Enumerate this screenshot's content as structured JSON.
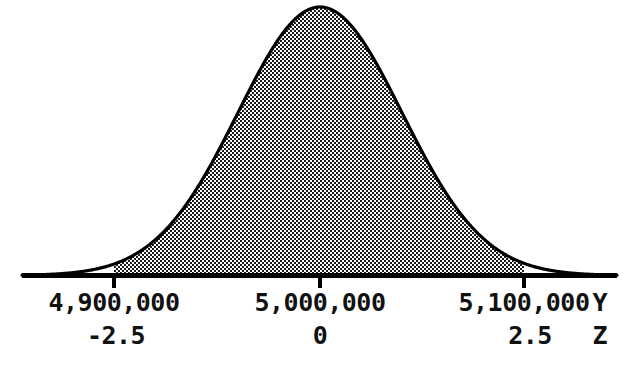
{
  "figure": {
    "background_color": "#ffffff",
    "ink_color": "#000000",
    "fill_style": "checkerboard-dither-gray"
  },
  "chart_data": {
    "type": "area",
    "title": "",
    "subtitle": "",
    "xlabel": "",
    "ylabel": "",
    "distribution": "normal",
    "mean": 5000000,
    "sigma": 40000,
    "grid": false,
    "legend": null,
    "axes": [
      {
        "name": "Y",
        "axis_name_label": "Y",
        "tick_values": [
          4900000,
          5000000,
          5100000
        ],
        "tick_labels": [
          "4,900,000",
          "5,000,000",
          "5,100,000"
        ]
      },
      {
        "name": "Z",
        "axis_name_label": "Z",
        "tick_values": [
          -2.5,
          0,
          2.5
        ],
        "tick_labels": [
          "-2.5",
          "0",
          "2.5"
        ]
      }
    ],
    "shaded_region": {
      "from_z": -2.5,
      "to_z": 2.5,
      "from_y": 4900000,
      "to_y": 5100000,
      "style": "dither-shaded"
    },
    "x": [
      -4.0,
      -3.8,
      -3.6,
      -3.4,
      -3.2,
      -3.0,
      -2.8,
      -2.6,
      -2.5,
      -2.4,
      -2.2,
      -2.0,
      -1.8,
      -1.6,
      -1.4,
      -1.2,
      -1.0,
      -0.8,
      -0.6,
      -0.4,
      -0.2,
      0.0,
      0.2,
      0.4,
      0.6,
      0.8,
      1.0,
      1.2,
      1.4,
      1.6,
      1.8,
      2.0,
      2.2,
      2.4,
      2.5,
      2.6,
      2.8,
      3.0,
      3.2,
      3.4,
      3.6,
      3.8,
      4.0
    ],
    "y": [
      0.0001,
      0.0003,
      0.0006,
      0.0012,
      0.0024,
      0.0044,
      0.0079,
      0.0136,
      0.0175,
      0.0224,
      0.0355,
      0.054,
      0.079,
      0.1109,
      0.1497,
      0.1942,
      0.242,
      0.2897,
      0.3332,
      0.3683,
      0.391,
      0.3989,
      0.391,
      0.3683,
      0.3332,
      0.2897,
      0.242,
      0.1942,
      0.1497,
      0.1109,
      0.079,
      0.054,
      0.0355,
      0.0224,
      0.0175,
      0.0136,
      0.0079,
      0.0044,
      0.0024,
      0.0012,
      0.0006,
      0.0003,
      0.0001
    ],
    "ylim": [
      0,
      0.4
    ],
    "xlim": [
      -4.0,
      4.0
    ]
  },
  "axis_labels": {
    "y_row": [
      {
        "text": "4,900,000",
        "x": 114
      },
      {
        "text": "5,000,000",
        "x": 320
      },
      {
        "text": "5,100,000",
        "x": 524
      }
    ],
    "z_row": [
      {
        "text": "-2.5",
        "x": 114
      },
      {
        "text": "0",
        "x": 320
      },
      {
        "text": "2.5",
        "x": 524
      }
    ],
    "y_axis_name": "Y",
    "z_axis_name": "Z"
  }
}
